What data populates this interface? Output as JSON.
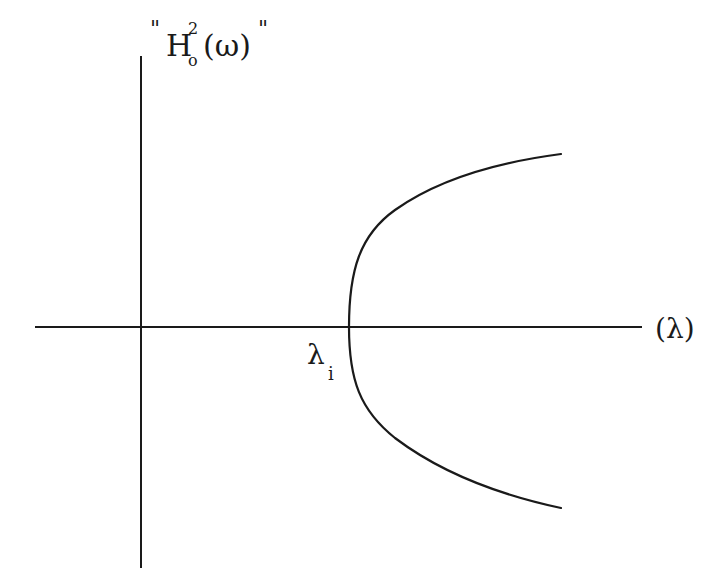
{
  "diagram": {
    "type": "hand-drawn plot",
    "stroke_color": "#1a1a1a",
    "background": "#ffffff",
    "y_axis": {
      "label_open_quote": "\"",
      "label_base": "H",
      "label_superscript": "2",
      "label_subscript": "o",
      "label_argument": "(ω)",
      "label_close_quote": "\""
    },
    "x_axis": {
      "label": "(λ)"
    },
    "curve": {
      "description": "sideways parabola opening to the right",
      "vertex_label_base": "λ",
      "vertex_label_subscript": "i"
    }
  }
}
